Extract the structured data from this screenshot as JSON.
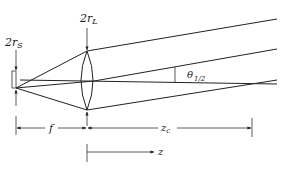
{
  "diagram": {
    "labels": {
      "source_size": {
        "main": "2r",
        "sub": "S"
      },
      "lens_size": {
        "main": "2r",
        "sub": "L"
      },
      "half_angle": {
        "main": "θ",
        "sub": "1/2"
      },
      "focal_length": {
        "main": "f",
        "sub": ""
      },
      "critical_distance": {
        "main": "z",
        "sub": "c"
      },
      "axis_coordinate": {
        "main": "z",
        "sub": ""
      }
    },
    "colors": {
      "line": "#222222",
      "background": "#ffffff"
    }
  }
}
